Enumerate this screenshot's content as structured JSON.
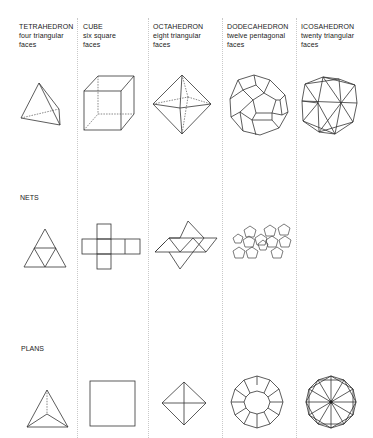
{
  "columns": [
    {
      "title": "TETRAHEDRON",
      "desc1": "four triangular",
      "desc2": "faces"
    },
    {
      "title": "CUBE",
      "desc1": "six square",
      "desc2": "faces"
    },
    {
      "title": "OCTAHEDRON",
      "desc1": "eight triangular",
      "desc2": "faces"
    },
    {
      "title": "DODECAHEDRON",
      "desc1": "twelve pentagonal",
      "desc2": "faces"
    },
    {
      "title": "ICOSAHEDRON",
      "desc1": "twenty triangular",
      "desc2": "faces"
    }
  ],
  "rows": {
    "solids_label": "",
    "nets_label": "NETS",
    "plans_label": "PLANS"
  },
  "colors": {
    "line": "#333333",
    "divider": "#c9c9c9",
    "background": "#ffffff"
  }
}
